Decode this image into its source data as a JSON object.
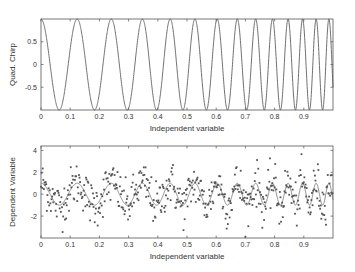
{
  "chart_data": [
    {
      "type": "line",
      "title": "",
      "xlabel": "Independent variable",
      "ylabel": "Quad. Chirp",
      "xlim": [
        0,
        1
      ],
      "ylim": [
        -1,
        1
      ],
      "xticks": [
        "0",
        "0.1",
        "0.2",
        "0.3",
        "0.4",
        "0.5",
        "0.6",
        "0.7",
        "0.8",
        "0.9"
      ],
      "yticks": [
        "-0.5",
        "0",
        "0.5"
      ],
      "grid": false,
      "series": [
        {
          "name": "quadratic chirp",
          "function": "cos(2*pi*(f0*t + k*t^3/3))",
          "f0": 8,
          "f1": 24,
          "color": "#707070"
        }
      ],
      "line_color": "#707070"
    },
    {
      "type": "scatter",
      "title": "",
      "xlabel": "Independent variable",
      "ylabel": "Dependent Variable",
      "xlim": [
        0,
        1
      ],
      "ylim": [
        -4,
        4.4
      ],
      "xticks": [
        "0",
        "0.1",
        "0.2",
        "0.3",
        "0.4",
        "0.5",
        "0.6",
        "0.7",
        "0.8",
        "0.9"
      ],
      "yticks": [
        "-2",
        "0",
        "2",
        "4"
      ],
      "grid": false,
      "series": [
        {
          "name": "noisy samples",
          "kind": "scatter",
          "n_points": 500,
          "noise_std": 1.0,
          "color": "#555555"
        },
        {
          "name": "underlying chirp",
          "kind": "line",
          "amplitude": 1,
          "color": "#707070"
        }
      ],
      "marker_color": "#555555",
      "line_color": "#707070"
    }
  ]
}
